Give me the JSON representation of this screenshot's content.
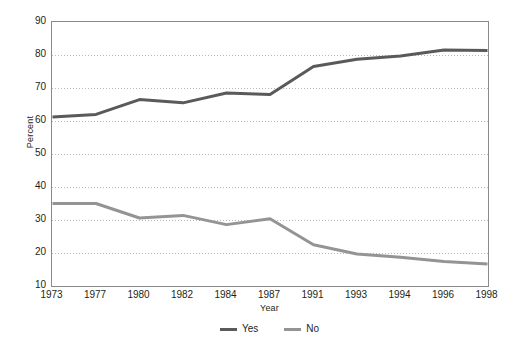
{
  "chart_data": {
    "type": "line",
    "title": "",
    "xlabel": "Year",
    "ylabel": "Percent",
    "categories": [
      "1973",
      "1977",
      "1980",
      "1982",
      "1984",
      "1987",
      "1991",
      "1993",
      "1994",
      "1996",
      "1998"
    ],
    "ylim": [
      10,
      90
    ],
    "yticks": [
      "90",
      "80",
      "70",
      "60",
      "50",
      "40",
      "30",
      "20",
      "10"
    ],
    "ytick_values": [
      90,
      80,
      70,
      60,
      50,
      40,
      30,
      20,
      10
    ],
    "grid": true,
    "grid_style": "dotted-horizontal",
    "legend_position": "bottom-center",
    "series": [
      {
        "name": "Yes",
        "color": "#5a5a5a",
        "values": [
          61.2,
          62.0,
          66.5,
          65.5,
          68.5,
          68.0,
          76.5,
          78.7,
          79.7,
          81.5,
          81.4
        ]
      },
      {
        "name": "No",
        "color": "#949494",
        "values": [
          35.0,
          35.0,
          30.6,
          31.4,
          28.6,
          30.4,
          22.5,
          19.7,
          18.7,
          17.4,
          16.7
        ]
      }
    ]
  },
  "axis": {
    "ylabel": "Percent",
    "xlabel": "Year"
  },
  "legend": {
    "items": [
      {
        "label": "Yes",
        "color": "#5a5a5a"
      },
      {
        "label": "No",
        "color": "#949494"
      }
    ]
  }
}
